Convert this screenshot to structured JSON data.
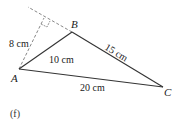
{
  "figure": {
    "caption": "(f)",
    "vertices": {
      "A": {
        "label": "A",
        "x": 19,
        "y": 69
      },
      "B": {
        "label": "B",
        "x": 72,
        "y": 32
      },
      "C": {
        "label": "C",
        "x": 163,
        "y": 87
      }
    },
    "sides": {
      "AB": {
        "label": "10 cm"
      },
      "BC": {
        "label": "15 cm"
      },
      "AC": {
        "label": "20 cm"
      }
    },
    "height": {
      "label": "8 cm",
      "foot": {
        "x": 44,
        "y": 18
      }
    },
    "colors": {
      "line": "#333333",
      "dashed": "#777777",
      "text": "#222222"
    }
  }
}
